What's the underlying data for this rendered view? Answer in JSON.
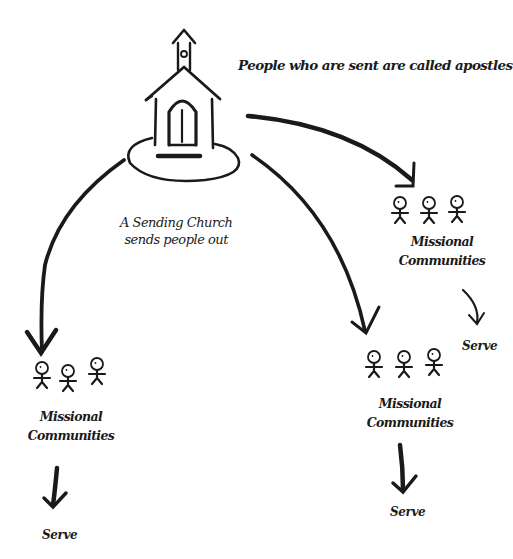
{
  "diagram": {
    "title": "People who are sent are called apostles",
    "center_node": {
      "icon": "church-icon",
      "label_line1": "A  Sending Church",
      "label_line2": "sends people out"
    },
    "communities": [
      {
        "id": "right",
        "label_line1": "Missional",
        "label_line2": "Communities",
        "action": "Serve"
      },
      {
        "id": "left",
        "label_line1": "Missional",
        "label_line2": "Communities",
        "action": "Serve"
      },
      {
        "id": "middle",
        "label_line1": "Missional",
        "label_line2": "Communities",
        "action": "Serve"
      }
    ],
    "edges": [
      {
        "from": "church",
        "to": "right"
      },
      {
        "from": "church",
        "to": "left"
      },
      {
        "from": "church",
        "to": "middle"
      },
      {
        "from": "right",
        "to": "right-serve"
      },
      {
        "from": "left",
        "to": "left-serve"
      },
      {
        "from": "middle",
        "to": "middle-serve"
      }
    ],
    "stroke_color": "#1a1a1a"
  }
}
